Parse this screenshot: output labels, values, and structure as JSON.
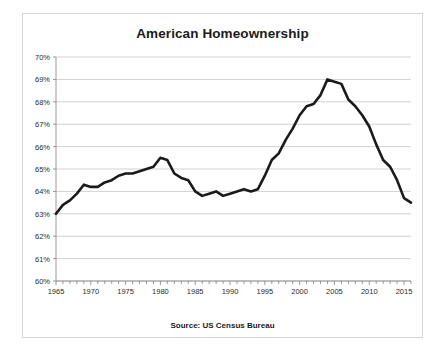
{
  "chart_data": {
    "type": "line",
    "title": "American Homeownership",
    "xlabel": "",
    "ylabel": "",
    "annotation": "Source: US Census Bureau",
    "grid": true,
    "legend": false,
    "xlim": [
      1965,
      2016
    ],
    "ylim": [
      60,
      70
    ],
    "ytick_labels": [
      "70%",
      "69%",
      "68%",
      "67%",
      "66%",
      "65%",
      "64%",
      "63%",
      "62%",
      "61%",
      "60%"
    ],
    "ytick_values": [
      70,
      69,
      68,
      67,
      66,
      65,
      64,
      63,
      62,
      61,
      60
    ],
    "xtick_labels": [
      "1965",
      "1970",
      "1975",
      "1980",
      "1985",
      "1990",
      "1995",
      "2000",
      "2005",
      "2010",
      "2015"
    ],
    "xtick_values": [
      1965,
      1970,
      1975,
      1980,
      1985,
      1990,
      1995,
      2000,
      2005,
      2010,
      2015
    ],
    "line_color": "#1a1a1a",
    "x": [
      1965,
      1966,
      1967,
      1968,
      1969,
      1970,
      1971,
      1972,
      1973,
      1974,
      1975,
      1976,
      1977,
      1978,
      1979,
      1980,
      1981,
      1982,
      1983,
      1984,
      1985,
      1986,
      1987,
      1988,
      1989,
      1990,
      1991,
      1992,
      1993,
      1994,
      1995,
      1996,
      1997,
      1998,
      1999,
      2000,
      2001,
      2002,
      2003,
      2004,
      2005,
      2006,
      2007,
      2008,
      2009,
      2010,
      2011,
      2012,
      2013,
      2014,
      2015,
      2016
    ],
    "values": [
      63.0,
      63.4,
      63.6,
      63.9,
      64.3,
      64.2,
      64.2,
      64.4,
      64.5,
      64.7,
      64.8,
      64.8,
      64.9,
      65.0,
      65.1,
      65.5,
      65.4,
      64.8,
      64.6,
      64.5,
      64.0,
      63.8,
      63.9,
      64.0,
      63.8,
      63.9,
      64.0,
      64.1,
      64.0,
      64.1,
      64.7,
      65.4,
      65.7,
      66.3,
      66.8,
      67.4,
      67.8,
      67.9,
      68.3,
      69.0,
      68.9,
      68.8,
      68.1,
      67.8,
      67.4,
      66.9,
      66.1,
      65.4,
      65.1,
      64.5,
      63.7,
      63.5
    ]
  }
}
